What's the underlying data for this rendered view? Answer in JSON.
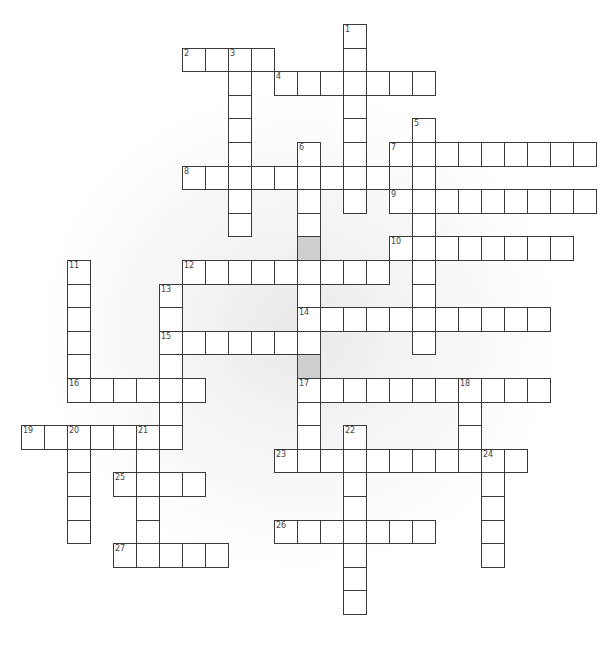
{
  "puzzle": {
    "grid": {
      "origin_x": 21,
      "origin_y": 24,
      "cell_w": 23,
      "cell_h": 23.6,
      "cell_fill": "#ffffff",
      "shaded_fill": "#cfcfcf",
      "border_color": "#3a3a3a"
    },
    "words": [
      {
        "number": "1",
        "dir": "down",
        "col": 14,
        "row": 0,
        "length": 8
      },
      {
        "number": "2",
        "dir": "across",
        "col": 7,
        "row": 1,
        "length": 4
      },
      {
        "number": "3",
        "dir": "down",
        "col": 9,
        "row": 1,
        "length": 8
      },
      {
        "number": "4",
        "dir": "across",
        "col": 11,
        "row": 2,
        "length": 7
      },
      {
        "number": "5",
        "dir": "down",
        "col": 17,
        "row": 4,
        "length": 10
      },
      {
        "number": "6",
        "dir": "down",
        "col": 12,
        "row": 5,
        "length": 14
      },
      {
        "number": "7",
        "dir": "across",
        "col": 16,
        "row": 5,
        "length": 9
      },
      {
        "number": "8",
        "dir": "across",
        "col": 7,
        "row": 6,
        "length": 9
      },
      {
        "number": "9",
        "dir": "across",
        "col": 16,
        "row": 7,
        "length": 9
      },
      {
        "number": "10",
        "dir": "across",
        "col": 16,
        "row": 9,
        "length": 8
      },
      {
        "number": "11",
        "dir": "down",
        "col": 2,
        "row": 10,
        "length": 6
      },
      {
        "number": "12",
        "dir": "across",
        "col": 7,
        "row": 10,
        "length": 9
      },
      {
        "number": "13",
        "dir": "down",
        "col": 6,
        "row": 11,
        "length": 7
      },
      {
        "number": "14",
        "dir": "across",
        "col": 12,
        "row": 12,
        "length": 11
      },
      {
        "number": "15",
        "dir": "across",
        "col": 6,
        "row": 13,
        "length": 7
      },
      {
        "number": "16",
        "dir": "across",
        "col": 2,
        "row": 15,
        "length": 6
      },
      {
        "number": "17",
        "dir": "across",
        "col": 12,
        "row": 15,
        "length": 11
      },
      {
        "number": "18",
        "dir": "down",
        "col": 19,
        "row": 15,
        "length": 3
      },
      {
        "number": "19",
        "dir": "across",
        "col": 0,
        "row": 17,
        "length": 7
      },
      {
        "number": "20",
        "dir": "down",
        "col": 2,
        "row": 17,
        "length": 5
      },
      {
        "number": "21",
        "dir": "down",
        "col": 5,
        "row": 17,
        "length": 6
      },
      {
        "number": "22",
        "dir": "down",
        "col": 14,
        "row": 17,
        "length": 8
      },
      {
        "number": "23",
        "dir": "across",
        "col": 11,
        "row": 18,
        "length": 11
      },
      {
        "number": "24",
        "dir": "down",
        "col": 20,
        "row": 18,
        "length": 5
      },
      {
        "number": "25",
        "dir": "across",
        "col": 4,
        "row": 19,
        "length": 4
      },
      {
        "number": "26",
        "dir": "across",
        "col": 11,
        "row": 21,
        "length": 7
      },
      {
        "number": "27",
        "dir": "across",
        "col": 4,
        "row": 22,
        "length": 5
      }
    ],
    "shaded_cells": [
      {
        "col": 12,
        "row": 9
      },
      {
        "col": 12,
        "row": 14
      }
    ]
  }
}
